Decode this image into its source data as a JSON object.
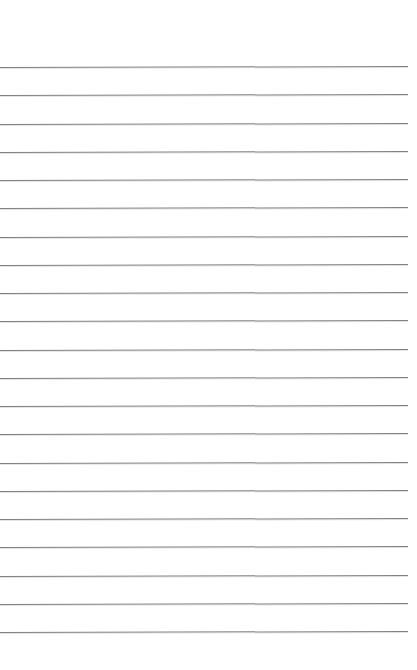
{
  "page": {
    "kind": "lined-paper-sheet",
    "width_px": 417,
    "height_px": 670,
    "background_color": "#ffffff",
    "content_text": ""
  },
  "ruling": {
    "line_color": "#808080",
    "line_thickness_px": 1,
    "line_count": 21,
    "first_line_y_px": 67,
    "last_line_y_px": 632,
    "line_spacing_px": 28.25,
    "line_start_x_px": 0,
    "line_end_x_px": 408,
    "right_margin_px": 9,
    "top_margin_px": 67,
    "bottom_margin_px": 38,
    "slant_px": -1,
    "lines": [
      {
        "index": 1,
        "y": 67,
        "text": ""
      },
      {
        "index": 2,
        "y": 95.25,
        "text": ""
      },
      {
        "index": 3,
        "y": 123.5,
        "text": ""
      },
      {
        "index": 4,
        "y": 151.75,
        "text": ""
      },
      {
        "index": 5,
        "y": 180,
        "text": ""
      },
      {
        "index": 6,
        "y": 208.25,
        "text": ""
      },
      {
        "index": 7,
        "y": 236.5,
        "text": ""
      },
      {
        "index": 8,
        "y": 264.75,
        "text": ""
      },
      {
        "index": 9,
        "y": 293,
        "text": ""
      },
      {
        "index": 10,
        "y": 321.25,
        "text": ""
      },
      {
        "index": 11,
        "y": 349.5,
        "text": ""
      },
      {
        "index": 12,
        "y": 377.75,
        "text": ""
      },
      {
        "index": 13,
        "y": 406,
        "text": ""
      },
      {
        "index": 14,
        "y": 434.25,
        "text": ""
      },
      {
        "index": 15,
        "y": 462.5,
        "text": ""
      },
      {
        "index": 16,
        "y": 490.75,
        "text": ""
      },
      {
        "index": 17,
        "y": 519,
        "text": ""
      },
      {
        "index": 18,
        "y": 547.25,
        "text": ""
      },
      {
        "index": 19,
        "y": 575.5,
        "text": ""
      },
      {
        "index": 20,
        "y": 603.75,
        "text": ""
      },
      {
        "index": 21,
        "y": 632,
        "text": ""
      }
    ]
  }
}
